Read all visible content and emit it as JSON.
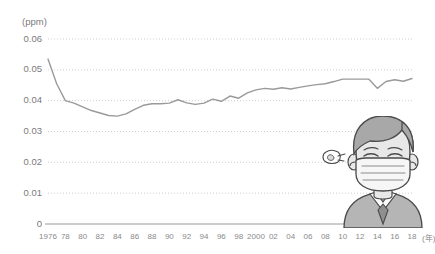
{
  "chart_data": {
    "type": "line",
    "title": "",
    "xlabel": "(年)",
    "ylabel": "(ppm)",
    "ylim": [
      0,
      0.06
    ],
    "xlim": [
      1976,
      2018
    ],
    "grid": true,
    "legend": null,
    "y_ticks": [
      "0",
      "0.01",
      "0.02",
      "0.03",
      "0.04",
      "0.05",
      "0.06"
    ],
    "y_tick_values": [
      0,
      0.01,
      0.02,
      0.03,
      0.04,
      0.05,
      0.06
    ],
    "x_tick_labels": [
      "1976",
      "78",
      "80",
      "82",
      "84",
      "86",
      "88",
      "90",
      "92",
      "94",
      "96",
      "98",
      "2000",
      "02",
      "04",
      "06",
      "08",
      "10",
      "12",
      "14",
      "16",
      "18"
    ],
    "x_tick_values": [
      1976,
      1978,
      1980,
      1982,
      1984,
      1986,
      1988,
      1990,
      1992,
      1994,
      1996,
      1998,
      2000,
      2002,
      2004,
      2006,
      2008,
      2010,
      2012,
      2014,
      2016,
      2018
    ],
    "series": [
      {
        "name": "濃度",
        "color": "#9a9a9a",
        "x": [
          1976,
          1977,
          1978,
          1979,
          1980,
          1981,
          1982,
          1983,
          1984,
          1985,
          1986,
          1987,
          1988,
          1989,
          1990,
          1991,
          1992,
          1993,
          1994,
          1995,
          1996,
          1997,
          1998,
          1999,
          2000,
          2001,
          2002,
          2003,
          2004,
          2005,
          2006,
          2007,
          2008,
          2009,
          2010,
          2011,
          2012,
          2013,
          2014,
          2015,
          2016,
          2017,
          2018
        ],
        "values": [
          0.0535,
          0.0455,
          0.04,
          0.0392,
          0.038,
          0.0368,
          0.036,
          0.0352,
          0.035,
          0.0357,
          0.0372,
          0.0385,
          0.039,
          0.039,
          0.0392,
          0.0403,
          0.0393,
          0.0388,
          0.0392,
          0.0405,
          0.0398,
          0.0415,
          0.0408,
          0.0425,
          0.0435,
          0.044,
          0.0437,
          0.0442,
          0.0438,
          0.0443,
          0.0448,
          0.0452,
          0.0455,
          0.0462,
          0.047,
          0.047,
          0.047,
          0.047,
          0.044,
          0.0462,
          0.0468,
          0.0463,
          0.0472
        ]
      }
    ]
  },
  "illustration": {
    "name": "person-wearing-mask",
    "alt": "マスクをした人のイラスト",
    "parts": [
      "hair",
      "face",
      "closed-eyes",
      "face-mask",
      "cough-hand",
      "shoulders",
      "necktie"
    ],
    "colors": {
      "hair": "#a8a8a8",
      "skin": "#e8e8e8",
      "mask": "#f4f4f4",
      "clothes": "#b5b5b5",
      "outline": "#4a4a4a"
    }
  },
  "style": {
    "line_color": "#9a9a9a",
    "grid_color": "#c9c9c9",
    "axis_color": "#9a9a9a",
    "text_color": "#7a7a7a",
    "background": "#ffffff"
  }
}
